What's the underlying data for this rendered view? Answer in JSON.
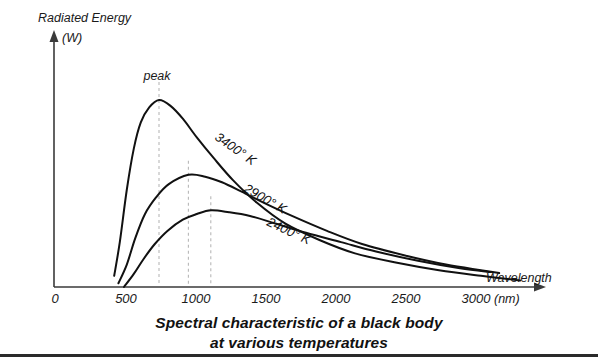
{
  "chart_data": {
    "type": "line",
    "caption_line1": "Spectral characteristic of a black body",
    "caption_line2": "at various temperatures",
    "xlabel": "Wavelength",
    "xunit": "(nm)",
    "ylabel": "Radiated Energy",
    "yunit": "(W)",
    "xlim": [
      0,
      3500
    ],
    "ylim": [
      0,
      1.05
    ],
    "grid": false,
    "legend": "inline-curve-labels",
    "xticks": [
      "0",
      "500",
      "1000",
      "1500",
      "2000",
      "2500",
      "3000"
    ],
    "xtick_values": [
      0,
      500,
      1000,
      1500,
      2000,
      2500,
      3000
    ],
    "yticks": [],
    "annotations": [
      {
        "text": "peak",
        "x": 750,
        "note": "marks wavelength of maximum radiated energy of the 3400 K curve"
      }
    ],
    "series": [
      {
        "name": "3400° K",
        "label": "3400° K",
        "temperature_k": 3400,
        "peak_x": 750,
        "peak_y": 1.0,
        "start_x": 430,
        "end_x": 3330,
        "points": [
          [
            430,
            0.06
          ],
          [
            470,
            0.24
          ],
          [
            520,
            0.52
          ],
          [
            570,
            0.74
          ],
          [
            620,
            0.88
          ],
          [
            680,
            0.96
          ],
          [
            750,
            1.0
          ],
          [
            830,
            0.97
          ],
          [
            920,
            0.9
          ],
          [
            1020,
            0.8
          ],
          [
            1140,
            0.69
          ],
          [
            1280,
            0.57
          ],
          [
            1450,
            0.45
          ],
          [
            1650,
            0.34
          ],
          [
            1900,
            0.25
          ],
          [
            2150,
            0.18
          ],
          [
            2450,
            0.13
          ],
          [
            2750,
            0.09
          ],
          [
            3050,
            0.06
          ],
          [
            3330,
            0.035
          ]
        ]
      },
      {
        "name": "2900° K",
        "label": "2900° K",
        "temperature_k": 2900,
        "peak_x": 960,
        "peak_y": 0.6,
        "start_x": 460,
        "end_x": 3180,
        "points": [
          [
            460,
            0.02
          ],
          [
            520,
            0.12
          ],
          [
            580,
            0.26
          ],
          [
            650,
            0.39
          ],
          [
            730,
            0.48
          ],
          [
            820,
            0.55
          ],
          [
            960,
            0.6
          ],
          [
            1080,
            0.59
          ],
          [
            1200,
            0.56
          ],
          [
            1340,
            0.51
          ],
          [
            1500,
            0.45
          ],
          [
            1700,
            0.38
          ],
          [
            1950,
            0.3
          ],
          [
            2200,
            0.23
          ],
          [
            2500,
            0.17
          ],
          [
            2800,
            0.12
          ],
          [
            3050,
            0.09
          ],
          [
            3180,
            0.075
          ]
        ]
      },
      {
        "name": "2400° K",
        "label": "2400° K",
        "temperature_k": 2400,
        "peak_x": 1120,
        "peak_y": 0.41,
        "start_x": 500,
        "end_x": 3120,
        "points": [
          [
            500,
            0.0
          ],
          [
            570,
            0.07
          ],
          [
            640,
            0.15
          ],
          [
            720,
            0.23
          ],
          [
            810,
            0.3
          ],
          [
            920,
            0.36
          ],
          [
            1020,
            0.39
          ],
          [
            1120,
            0.41
          ],
          [
            1250,
            0.4
          ],
          [
            1400,
            0.38
          ],
          [
            1580,
            0.34
          ],
          [
            1800,
            0.29
          ],
          [
            2050,
            0.24
          ],
          [
            2300,
            0.19
          ],
          [
            2600,
            0.14
          ],
          [
            2900,
            0.1
          ],
          [
            3120,
            0.08
          ]
        ]
      }
    ],
    "peak_markers": [
      {
        "series": "3400° K",
        "x": 750,
        "y": 1.0
      },
      {
        "series": "2900° K",
        "x": 960,
        "y": 0.6
      },
      {
        "series": "2400° K",
        "x": 1120,
        "y": 0.41
      }
    ],
    "colors": {
      "curve": "#111111",
      "axis": "#3a3a3a",
      "peak_dashed_line": "#b8b8b8",
      "background": "#ffffff",
      "bottom_rule": "#2a2a2a"
    }
  }
}
